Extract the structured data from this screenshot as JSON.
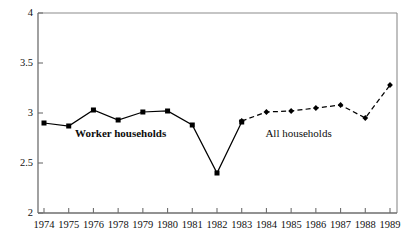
{
  "chart_data": {
    "type": "line",
    "title": "",
    "subtitle": "",
    "xlabel": "",
    "ylabel": "",
    "x": [
      "1974",
      "1975",
      "1976",
      "1978",
      "1979",
      "1980",
      "1981",
      "1982",
      "1983",
      "1984",
      "1985",
      "1986",
      "1987",
      "1988",
      "1989"
    ],
    "categories": [
      "1974",
      "1975",
      "1976",
      "1978",
      "1979",
      "1980",
      "1981",
      "1982",
      "1983",
      "1984",
      "1985",
      "1986",
      "1987",
      "1988",
      "1989"
    ],
    "xlim": [
      0,
      14
    ],
    "ylim": [
      2,
      4
    ],
    "yticks": [
      2,
      2.5,
      3,
      3.5,
      4
    ],
    "ytick_labels": [
      "2",
      "2.5",
      "3",
      "3.5",
      "4"
    ],
    "grid": false,
    "legend": "inline-annotations",
    "series": [
      {
        "name": "Worker households",
        "style": "solid",
        "marker": "square",
        "color": "#000000",
        "x": [
          "1974",
          "1975",
          "1976",
          "1978",
          "1979",
          "1980",
          "1981",
          "1982",
          "1983"
        ],
        "values": [
          2.9,
          2.87,
          3.03,
          2.93,
          3.01,
          3.02,
          2.88,
          2.4,
          2.91
        ]
      },
      {
        "name": "All households",
        "style": "dashed",
        "marker": "diamond",
        "color": "#000000",
        "x": [
          "1983",
          "1984",
          "1985",
          "1986",
          "1987",
          "1988",
          "1989"
        ],
        "values": [
          2.92,
          3.01,
          3.02,
          3.05,
          3.08,
          2.95,
          3.28
        ]
      }
    ],
    "annotations": [
      {
        "text": "Worker households",
        "x_index": 3.1,
        "y": 2.8,
        "bold": true
      },
      {
        "text": "All households",
        "x_index": 10.3,
        "y": 2.8,
        "bold": false
      }
    ],
    "frame": {
      "top": true,
      "left": true,
      "right": true,
      "bottom": true,
      "color": "#8c8c8c",
      "axis_color": "#6e6e6e"
    }
  }
}
